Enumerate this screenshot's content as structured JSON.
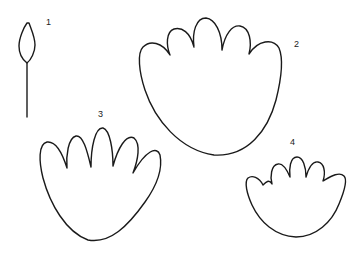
{
  "figure": {
    "background": "#ffffff",
    "stroke_color": "#1a1a1a",
    "items": [
      {
        "id": "1",
        "label": "1",
        "description": "closed bud on a stem"
      },
      {
        "id": "2",
        "label": "2",
        "description": "wide rounded shape with five short rounded lobes"
      },
      {
        "id": "3",
        "label": "3",
        "description": "fan shape with five tall finger-like lobes"
      },
      {
        "id": "4",
        "label": "4",
        "description": "small rounded shape with five short wavy lobes"
      }
    ]
  }
}
